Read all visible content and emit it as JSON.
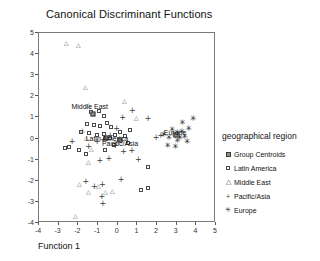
{
  "chart_data": {
    "type": "scatter",
    "title": "Canonical Discriminant Functions",
    "xlabel": "Function 1",
    "ylabel": "Function 2",
    "xlim": [
      -4,
      5
    ],
    "ylim": [
      -4,
      5
    ],
    "xticks": [
      -4,
      -3,
      -2,
      -1,
      0,
      1,
      2,
      3,
      4,
      5
    ],
    "yticks": [
      -4,
      -3,
      -2,
      -1,
      0,
      1,
      2,
      3,
      4,
      5
    ],
    "grid": false,
    "legend_position": "right",
    "legend_title": "geographical region",
    "series": [
      {
        "name": "Latin America",
        "marker": "square-open",
        "points": [
          [
            -1.35,
            1.25
          ],
          [
            -0.95,
            1.3
          ],
          [
            -0.7,
            1.05
          ],
          [
            -1.55,
            0.7
          ],
          [
            -1.2,
            0.62
          ],
          [
            -0.88,
            0.6
          ],
          [
            -0.55,
            0.72
          ],
          [
            -0.35,
            0.55
          ],
          [
            -1.85,
            0.3
          ],
          [
            -1.45,
            0.25
          ],
          [
            -1.05,
            0.15
          ],
          [
            -0.72,
            0.22
          ],
          [
            -0.4,
            0.05
          ],
          [
            -0.15,
            0.18
          ],
          [
            0.1,
            0.3
          ],
          [
            0.35,
            0.1
          ],
          [
            -2.7,
            -0.45
          ],
          [
            -2.45,
            -0.42
          ],
          [
            -1.95,
            -0.55
          ],
          [
            -1.6,
            -0.75
          ],
          [
            -0.62,
            -0.52
          ],
          [
            0.55,
            -0.2
          ],
          [
            0.62,
            0.42
          ],
          [
            -0.2,
            -0.3
          ],
          [
            1.55,
            -1.35
          ],
          [
            1.2,
            -2.45
          ],
          [
            1.55,
            -2.35
          ]
        ]
      },
      {
        "name": "Middle East",
        "marker": "triangle-open",
        "points": [
          [
            -2.6,
            4.35
          ],
          [
            -1.98,
            4.48
          ],
          [
            -1.62,
            2.75
          ],
          [
            -1.45,
            2.1
          ],
          [
            0.35,
            2.55
          ],
          [
            1.0,
            1.95
          ],
          [
            -1.75,
            1.62
          ],
          [
            -1.58,
            1.5
          ],
          [
            -1.3,
            1.22
          ],
          [
            -1.48,
            0.82
          ],
          [
            -1.92,
            0.05
          ],
          [
            -1.45,
            -0.12
          ],
          [
            -0.95,
            0.42
          ],
          [
            -0.58,
            0.38
          ],
          [
            -0.25,
            0.62
          ],
          [
            -2.1,
            -0.3
          ]
        ]
      },
      {
        "name": "Pacific/Asia",
        "marker": "plus",
        "points": [
          [
            0.75,
            1.3
          ],
          [
            1.55,
            0.95
          ],
          [
            0.25,
            0.98
          ],
          [
            -0.05,
            0.45
          ],
          [
            -0.38,
            0.1
          ],
          [
            -0.72,
            -0.05
          ],
          [
            -1.05,
            -0.18
          ],
          [
            -1.48,
            -0.42
          ],
          [
            -2.32,
            -0.18
          ],
          [
            -0.12,
            -0.35
          ],
          [
            0.3,
            -0.62
          ],
          [
            0.72,
            -0.58
          ],
          [
            -0.45,
            -0.95
          ],
          [
            -0.9,
            -1.05
          ],
          [
            1.05,
            -1.02
          ],
          [
            1.95,
            0.02
          ],
          [
            2.2,
            0.12
          ],
          [
            -1.62,
            -2.05
          ],
          [
            -1.18,
            -2.3
          ],
          [
            -0.78,
            -2.22
          ],
          [
            -0.8,
            -2.78
          ],
          [
            -0.75,
            -3.1
          ],
          [
            0.18,
            -1.95
          ]
        ]
      },
      {
        "name": "Europe",
        "marker": "star",
        "points": [
          [
            2.35,
            0.18
          ],
          [
            2.62,
            0.05
          ],
          [
            2.78,
            0.42
          ],
          [
            2.92,
            0.12
          ],
          [
            3.05,
            0.28
          ],
          [
            3.18,
            0.02
          ],
          [
            3.28,
            0.32
          ],
          [
            3.42,
            0.08
          ],
          [
            3.55,
            -0.18
          ],
          [
            2.95,
            -0.42
          ],
          [
            3.3,
            0.72
          ],
          [
            3.85,
            0.95
          ],
          [
            2.55,
            -0.35
          ],
          [
            3.62,
            0.45
          ],
          [
            3.05,
            -0.12
          ]
        ]
      },
      {
        "name": "Group Centroids",
        "marker": "square-filled",
        "points": [
          [
            -0.58,
            0.02
          ],
          [
            -1.25,
            1.18
          ],
          [
            0.12,
            -0.08
          ],
          [
            2.95,
            0.15
          ]
        ]
      }
    ],
    "annotations": [
      {
        "text": "Middle East",
        "x": -1.42,
        "y": 1.55
      },
      {
        "text": "Latin America",
        "x": -0.55,
        "y": 0.05
      },
      {
        "text": "Pacific/Asia",
        "x": 0.12,
        "y": -0.22
      },
      {
        "text": "Europe",
        "x": 2.92,
        "y": 0.32
      }
    ]
  },
  "legend": {
    "title": "geographical region",
    "items": [
      {
        "label": "Group Centroids",
        "marker": "square-filled"
      },
      {
        "label": "Latin America",
        "marker": "square-open"
      },
      {
        "label": "Middle East",
        "marker": "triangle-open"
      },
      {
        "label": "Pacific/Asia",
        "marker": "plus"
      },
      {
        "label": "Europe",
        "marker": "star"
      }
    ]
  }
}
